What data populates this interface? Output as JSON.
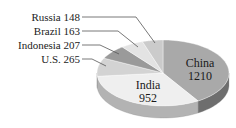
{
  "chart_data": {
    "type": "pie",
    "style": "3d-exploded-none",
    "title": "",
    "title_note": "Title clipped at top edge; not legible",
    "start_angle": "12 o'clock",
    "direction": "clockwise",
    "slices": [
      {
        "label": "China",
        "value": 1210,
        "color": "#a9a9a9",
        "side_color": "#6e6e6e",
        "label_position": "inside"
      },
      {
        "label": "India",
        "value": 952,
        "color": "#efefef",
        "side_color": "#b3b3b3",
        "label_position": "inside"
      },
      {
        "label": "U.S.",
        "value": 265,
        "color": "#d3d3d3",
        "side_color": "#9c9c9c",
        "label_position": "outside-left"
      },
      {
        "label": "Indonesia",
        "value": 207,
        "color": "#9a9a9a",
        "side_color": "#777777",
        "label_position": "outside-left"
      },
      {
        "label": "Brazil",
        "value": 163,
        "color": "#e3e3e3",
        "side_color": "#b0b0b0",
        "label_position": "outside-left"
      },
      {
        "label": "Russia",
        "value": 148,
        "color": "#cbcbcb",
        "side_color": "#999999",
        "label_position": "outside-left"
      }
    ],
    "legend": "none (leader-line labels)"
  },
  "labels": {
    "china": {
      "name": "China",
      "value": "1210"
    },
    "india": {
      "name": "India",
      "value": "952"
    },
    "us": {
      "text": "U.S.  265"
    },
    "indonesia": {
      "text": "Indonesia  207"
    },
    "brazil": {
      "text": "Brazil  163"
    },
    "russia": {
      "text": "Russia  148"
    }
  }
}
